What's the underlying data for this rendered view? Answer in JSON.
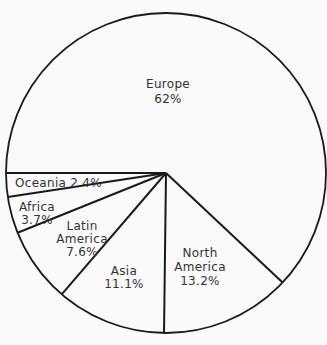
{
  "chart_data": {
    "type": "pie",
    "title": "",
    "categories": [
      "Europe",
      "North America",
      "Asia",
      "Latin America",
      "Africa",
      "Oceania"
    ],
    "values": [
      62,
      13.2,
      11.1,
      7.6,
      3.7,
      2.4
    ],
    "unit": "%",
    "start_angle_deg": 180,
    "direction": "counterclockwise-from-left (screen: downward on left side)",
    "order_from_start": [
      "Oceania",
      "Africa",
      "Latin America",
      "Asia",
      "North America",
      "Europe"
    ],
    "legend": "none (labels inside slices)",
    "labels": [
      {
        "category": "Europe",
        "lines": [
          "Europe",
          "62%"
        ]
      },
      {
        "category": "North America",
        "lines": [
          "North",
          "America",
          "13.2%"
        ]
      },
      {
        "category": "Asia",
        "lines": [
          "Asia",
          "11.1%"
        ]
      },
      {
        "category": "Latin America",
        "lines": [
          "Latin",
          "America",
          "7.6%"
        ]
      },
      {
        "category": "Africa",
        "lines": [
          "Africa",
          "3.7%"
        ]
      },
      {
        "category": "Oceania",
        "lines": [
          "Oceania 2.4%"
        ]
      }
    ]
  },
  "style": {
    "line_color": "#1a1a1a",
    "text_color": "#333333",
    "background": "#fafafa"
  }
}
